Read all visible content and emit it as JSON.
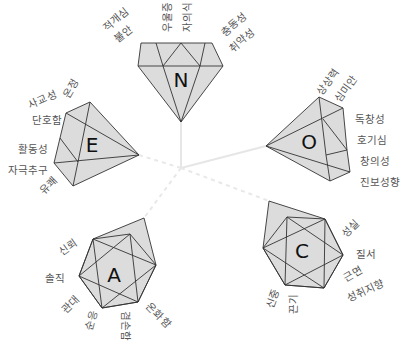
{
  "diagram": {
    "type": "big-five-personality-gems",
    "center": [
      181,
      168
    ],
    "factors": [
      {
        "letter": "N",
        "facets": [
          "적개심",
          "불안",
          "우울증",
          "자의식",
          "충동성",
          "취약성"
        ]
      },
      {
        "letter": "E",
        "facets": [
          "온정",
          "사교성",
          "단호함",
          "활동성",
          "자극추구",
          "유쾌"
        ]
      },
      {
        "letter": "O",
        "facets": [
          "상상력",
          "심미안",
          "독창성",
          "호기심",
          "창의성",
          "진보성향"
        ]
      },
      {
        "letter": "C",
        "facets": [
          "성실",
          "질서",
          "근면",
          "성취지향",
          "신중",
          "끈기"
        ]
      },
      {
        "letter": "A",
        "facets": [
          "신뢰",
          "솔직",
          "관대",
          "순응",
          "겸손함",
          "온화함"
        ]
      }
    ],
    "colors": {
      "gem_fill": "#dcdcdc",
      "gem_stroke": "#333333",
      "label": "#555555",
      "spoke": "#e6e6e6"
    }
  }
}
